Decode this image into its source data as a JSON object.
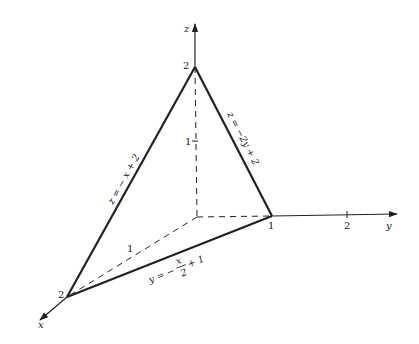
{
  "diagram": {
    "type": "3d-plane-intercepts",
    "colors": {
      "ink": "#222222",
      "background": "#ffffff"
    },
    "axes": {
      "x": {
        "label": "x"
      },
      "y": {
        "label": "y"
      },
      "z": {
        "label": "z"
      }
    },
    "ticks": {
      "z_top": "2",
      "z_mid": "1",
      "x_mid": "1",
      "x_vertex": "2",
      "y_vertex": "1",
      "y_mid": "2"
    },
    "edges": {
      "xz_trace": {
        "equation": "z = − x + 2"
      },
      "yz_trace": {
        "equation": "z = −2y + 2"
      },
      "xy_trace": {
        "lhs": "y = −",
        "frac_num": "x",
        "frac_den": "2",
        "rhs": "+ 1"
      }
    },
    "vertices": [
      {
        "name": "z-intercept",
        "coords": [
          0,
          0,
          2
        ]
      },
      {
        "name": "x-intercept",
        "coords": [
          2,
          0,
          0
        ]
      },
      {
        "name": "y-intercept",
        "coords": [
          0,
          1,
          0
        ]
      }
    ]
  }
}
